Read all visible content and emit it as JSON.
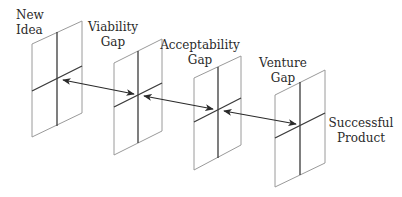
{
  "diagram": {
    "colors": {
      "background": "#ffffff",
      "panel_outline": "#9a9a9a",
      "panel_divider": "#3a3a3a",
      "arrow": "#2a2a2a",
      "text": "#2a2a2a"
    },
    "stages": [
      {
        "id": "new-idea",
        "label_lines": [
          "New",
          "Idea"
        ]
      },
      {
        "id": "viability-gap",
        "label_lines": [
          "Viability",
          "Gap"
        ]
      },
      {
        "id": "acceptability-gap",
        "label_lines": [
          "Acceptability",
          "Gap"
        ]
      },
      {
        "id": "venture-gap",
        "label_lines": [
          "Venture",
          "Gap"
        ]
      },
      {
        "id": "successful-product",
        "label_lines": [
          "Successful",
          "Product"
        ]
      }
    ],
    "panels": [
      {
        "name": "panel-1",
        "tl": [
          32,
          44
        ],
        "tr": [
          82,
          21
        ],
        "br": [
          82,
          113
        ],
        "bl": [
          32,
          137
        ],
        "center": [
          57,
          79
        ],
        "h_left": [
          32,
          91
        ],
        "h_right": [
          82,
          66
        ],
        "v_top": [
          57,
          32
        ],
        "v_bot": [
          57,
          126
        ]
      },
      {
        "name": "panel-2",
        "tl": [
          114,
          63
        ],
        "tr": [
          162,
          39
        ],
        "br": [
          162,
          131
        ],
        "bl": [
          114,
          155
        ],
        "center": [
          138,
          95
        ],
        "h_left": [
          114,
          107
        ],
        "h_right": [
          162,
          83
        ],
        "v_top": [
          138,
          51
        ],
        "v_bot": [
          138,
          143
        ]
      },
      {
        "name": "panel-3",
        "tl": [
          194,
          78
        ],
        "tr": [
          241,
          56
        ],
        "br": [
          241,
          145
        ],
        "bl": [
          194,
          170
        ],
        "center": [
          218,
          110
        ],
        "h_left": [
          194,
          122
        ],
        "h_right": [
          241,
          98
        ],
        "v_top": [
          218,
          67
        ],
        "v_bot": [
          218,
          158
        ]
      },
      {
        "name": "panel-4",
        "tl": [
          275,
          95
        ],
        "tr": [
          325,
          70
        ],
        "br": [
          325,
          163
        ],
        "bl": [
          275,
          187
        ],
        "center": [
          300,
          125
        ],
        "h_left": [
          275,
          138
        ],
        "h_right": [
          325,
          113
        ],
        "v_top": [
          300,
          82
        ],
        "v_bot": [
          300,
          175
        ]
      }
    ],
    "arrows": [
      {
        "name": "viability-gap-arrow",
        "from": [
          63,
          80
        ],
        "to": [
          134,
          94
        ]
      },
      {
        "name": "acceptability-gap-arrow",
        "from": [
          144,
          96
        ],
        "to": [
          213,
          109
        ]
      },
      {
        "name": "venture-gap-arrow",
        "from": [
          224,
          111
        ],
        "to": [
          296,
          124
        ]
      }
    ]
  }
}
